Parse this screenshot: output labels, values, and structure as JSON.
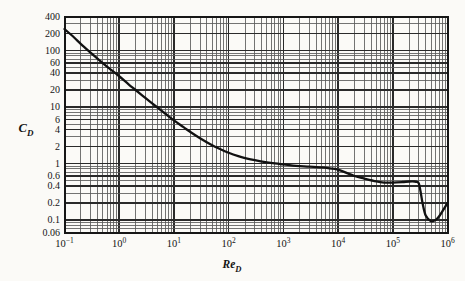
{
  "figure": {
    "background_color": "#fbfaf7",
    "ink_color": "#161616",
    "grid_major_color": "#2a2a2a",
    "grid_minor_color": "#5a5a5a",
    "curve_color": "#111111"
  },
  "axes": {
    "x_label": "Re",
    "x_label_sub": "D",
    "y_label": "C",
    "y_label_sub": "D",
    "x_scale": "log",
    "y_scale": "log",
    "x_ticks": [
      {
        "value": 0.1,
        "mantissa": "10",
        "exponent": "−1"
      },
      {
        "value": 1,
        "mantissa": "10",
        "exponent": "0"
      },
      {
        "value": 10,
        "mantissa": "10",
        "exponent": "1"
      },
      {
        "value": 100,
        "mantissa": "10",
        "exponent": "2"
      },
      {
        "value": 1000,
        "mantissa": "10",
        "exponent": "3"
      },
      {
        "value": 10000,
        "mantissa": "10",
        "exponent": "4"
      },
      {
        "value": 100000,
        "mantissa": "10",
        "exponent": "5"
      },
      {
        "value": 1000000,
        "mantissa": "10",
        "exponent": "6"
      }
    ],
    "y_ticks": [
      {
        "value": 400,
        "label": "400"
      },
      {
        "value": 200,
        "label": "200"
      },
      {
        "value": 100,
        "label": "100"
      },
      {
        "value": 60,
        "label": "60"
      },
      {
        "value": 40,
        "label": "40"
      },
      {
        "value": 20,
        "label": "20"
      },
      {
        "value": 10,
        "label": "10"
      },
      {
        "value": 6,
        "label": "6"
      },
      {
        "value": 4,
        "label": "4"
      },
      {
        "value": 2,
        "label": "2"
      },
      {
        "value": 1,
        "label": "1"
      },
      {
        "value": 0.6,
        "label": "0.6"
      },
      {
        "value": 0.4,
        "label": "0.4"
      },
      {
        "value": 0.2,
        "label": "0.2"
      },
      {
        "value": 0.1,
        "label": "0.1"
      },
      {
        "value": 0.06,
        "label": "0.06"
      }
    ]
  },
  "chart_data": {
    "type": "line",
    "title": "",
    "xlabel": "Re_D",
    "ylabel": "C_D",
    "xscale": "log",
    "yscale": "log",
    "xlim": [
      0.1,
      1000000
    ],
    "ylim": [
      0.06,
      400
    ],
    "grid": true,
    "legend": "none",
    "series": [
      {
        "name": "Drag coefficient of a smooth circular cylinder",
        "x": [
          0.1,
          0.15,
          0.2,
          0.3,
          0.5,
          0.7,
          1.0,
          1.5,
          2.0,
          3.0,
          5.0,
          7.0,
          10,
          15,
          20,
          30,
          50,
          70,
          100,
          150,
          200,
          300,
          500,
          700,
          1000,
          1500,
          2000,
          3000,
          5000,
          7000,
          10000,
          20000,
          30000,
          50000,
          70000,
          100000,
          150000,
          200000,
          250000,
          280000,
          300000,
          320000,
          350000,
          400000,
          500000,
          600000,
          700000,
          1000000
        ],
        "y": [
          240,
          170,
          130,
          92,
          60,
          46,
          35,
          25,
          20,
          14.5,
          9.8,
          7.6,
          5.8,
          4.4,
          3.6,
          2.8,
          2.1,
          1.8,
          1.55,
          1.35,
          1.25,
          1.15,
          1.05,
          1.0,
          0.96,
          0.92,
          0.9,
          0.88,
          0.85,
          0.82,
          0.78,
          0.6,
          0.54,
          0.48,
          0.46,
          0.46,
          0.47,
          0.48,
          0.48,
          0.47,
          0.44,
          0.33,
          0.2,
          0.12,
          0.095,
          0.1,
          0.115,
          0.2
        ]
      }
    ]
  }
}
